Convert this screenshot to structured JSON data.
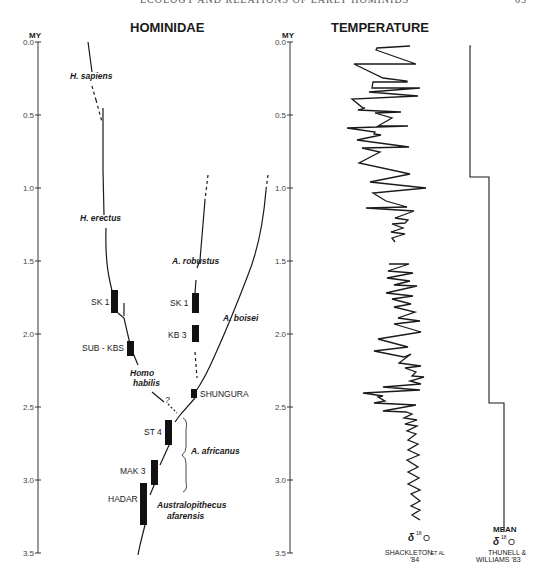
{
  "page_header": {
    "left": "ECOLOGY AND RELATIONS OF EARLY HOMINIDS",
    "right": "65"
  },
  "panels": {
    "hominidae": {
      "title": "HOMINIDAE",
      "axis_label": "MY"
    },
    "temperature": {
      "title": "TEMPERATURE",
      "axis_label": "MY"
    }
  },
  "axis": {
    "ticks": [
      "0.0",
      "0.5",
      "1.0",
      "1.5",
      "2.0",
      "2.5",
      "3.0",
      "3.5"
    ],
    "min": 0,
    "max": 3.5
  },
  "taxa": {
    "h_sapiens": "H. sapiens",
    "h_erectus": "H. erectus",
    "homo_habilis_1": "Homo",
    "homo_habilis_2": "habilis",
    "question": "?",
    "a_robustus": "A. robustus",
    "a_boisei": "A. boisei",
    "a_africanus": "A. africanus",
    "afarensis_1": "Australopithecus",
    "afarensis_2": "afarensis"
  },
  "sites": {
    "sk1_homo": "SK 1",
    "sub_kbs": "SUB - KBS",
    "sk1_robustus": "SK 1",
    "kb3": "KB 3",
    "shungura": "SHUNGURA",
    "st4": "ST 4",
    "mak3": "MAK 3",
    "hadar": "HADAR"
  },
  "temperature_labels": {
    "delta_left": "δ",
    "sup_left": "18",
    "o_left": "O",
    "source_left_1": "SHACKLETON",
    "source_left_etal": "ET AL",
    "source_left_2": "'84",
    "mean": "MEAN",
    "delta_right": "δ",
    "sup_right": "18",
    "o_right": "O",
    "source_right_1": "THUNELL &",
    "source_right_2": "WILLIAMS '83"
  },
  "chart_data": {
    "type": "line",
    "ylabel": "MY",
    "ylim": [
      0,
      3.5
    ],
    "y_ticks": [
      0.0,
      0.5,
      1.0,
      1.5,
      2.0,
      2.5,
      3.0,
      3.5
    ],
    "fossil_ranges_my": [
      {
        "site": "SK 1 (Homo)",
        "start": 1.72,
        "end": 1.83
      },
      {
        "site": "SUB-KBS",
        "start": 2.05,
        "end": 2.15
      },
      {
        "site": "SK 1 (A. robustus)",
        "start": 1.73,
        "end": 1.87
      },
      {
        "site": "KB 3",
        "start": 1.94,
        "end": 2.06
      },
      {
        "site": "SHUNGURA",
        "start": 2.37,
        "end": 2.43
      },
      {
        "site": "ST 4",
        "start": 2.62,
        "end": 2.78
      },
      {
        "site": "MAK 3",
        "start": 2.88,
        "end": 3.05
      },
      {
        "site": "HADAR",
        "start": 3.02,
        "end": 3.32
      }
    ],
    "mean_delta18O_steps": [
      {
        "from_my": 0.0,
        "to_my": 0.92,
        "level": "warm"
      },
      {
        "from_my": 0.92,
        "to_my": 2.52,
        "level": "intermediate"
      },
      {
        "from_my": 2.52,
        "to_my": 3.4,
        "level": "cool"
      }
    ],
    "series": [
      {
        "name": "δ18O Shackleton et al '84",
        "segments": [
          "0.0-1.23 MY",
          "1.52-3.4 MY"
        ]
      },
      {
        "name": "Mean δ18O Thunell & Williams '83",
        "segments": [
          "0.0-3.4 MY stepwise"
        ]
      }
    ]
  }
}
